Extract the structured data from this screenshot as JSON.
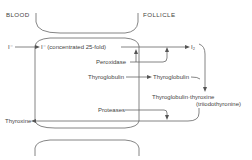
{
  "diagram": {
    "regions": {
      "blood": "BLOOD",
      "follicle": "FOLLICLE"
    },
    "nodes": {
      "iodide_blood": "I⁻",
      "iodide_concentrated": "I⁻ (concentrated 25-fold)",
      "iodine": "I₂",
      "peroxidase": "Peroxidase",
      "thyroglobulin_source": "Thyroglobulin",
      "thyroglobulin": "Thyroglobulin",
      "thyroglobulin_thyroxine": "Thyroglobulin·thyroxine",
      "triiodothyronine": "(triiodothyronine)",
      "proteases": "Proteases",
      "thyroxine": "Thyroxine"
    },
    "edges": [
      {
        "from": "iodide_blood",
        "to": "iodide_concentrated"
      },
      {
        "from": "iodide_concentrated",
        "to": "iodine",
        "via": "peroxidase"
      },
      {
        "from": "thyroglobulin_source",
        "to": "thyroglobulin"
      },
      {
        "from": "iodine",
        "to": "thyroglobulin_thyroxine"
      },
      {
        "from": "thyroglobulin",
        "to": "thyroglobulin_thyroxine"
      },
      {
        "from": "thyroglobulin_thyroxine",
        "to": "thyroxine",
        "via": "proteases"
      }
    ],
    "colors": {
      "line": "#666666",
      "text": "#444444",
      "background": "#ffffff"
    }
  }
}
